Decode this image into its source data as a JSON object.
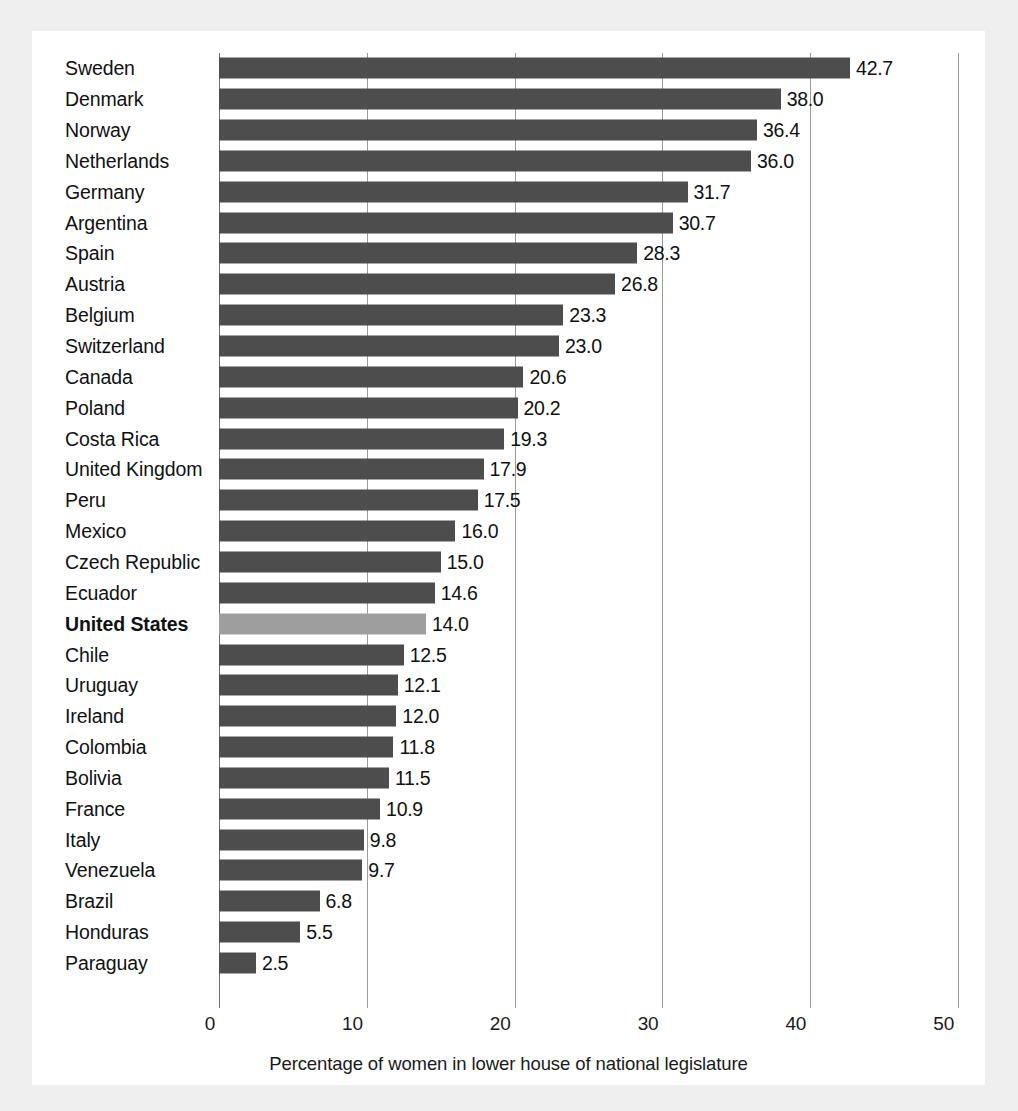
{
  "figure": {
    "panel_background": "#ffffff",
    "page_background": "#efefef",
    "bar_color": "#4d4d4d",
    "highlight_bar_color": "#9e9e9e",
    "gridline_color": "#9a9a9a"
  },
  "chart_data": {
    "type": "bar",
    "orientation": "horizontal",
    "title": "",
    "subtitle": "",
    "xlabel": "Percentage of women in lower house of national legislature",
    "ylabel": "",
    "xlim": [
      0,
      50
    ],
    "xticks": [
      "0",
      "10",
      "20",
      "30",
      "40",
      "50"
    ],
    "xtick_values": [
      0,
      10,
      20,
      30,
      40,
      50
    ],
    "grid": true,
    "grid_axis": "x",
    "legend": false,
    "legend_position": "none",
    "highlight_category": "United States",
    "value_label_format": "one-decimal",
    "categories": [
      "Sweden",
      "Denmark",
      "Norway",
      "Netherlands",
      "Germany",
      "Argentina",
      "Spain",
      "Austria",
      "Belgium",
      "Switzerland",
      "Canada",
      "Poland",
      "Costa Rica",
      "United Kingdom",
      "Peru",
      "Mexico",
      "Czech Republic",
      "Ecuador",
      "United States",
      "Chile",
      "Uruguay",
      "Ireland",
      "Colombia",
      "Bolivia",
      "France",
      "Italy",
      "Venezuela",
      "Brazil",
      "Honduras",
      "Paraguay"
    ],
    "values": [
      42.7,
      38.0,
      36.4,
      36.0,
      31.7,
      30.7,
      28.3,
      26.8,
      23.3,
      23.0,
      20.6,
      20.2,
      19.3,
      17.9,
      17.5,
      16.0,
      15.0,
      14.6,
      14.0,
      12.5,
      12.1,
      12.0,
      11.8,
      11.5,
      10.9,
      9.8,
      9.7,
      6.8,
      5.5,
      2.5
    ],
    "value_labels": [
      "42.7",
      "38.0",
      "36.4",
      "36.0",
      "31.7",
      "30.7",
      "28.3",
      "26.8",
      "23.3",
      "23.0",
      "20.6",
      "20.2",
      "19.3",
      "17.9",
      "17.5",
      "16.0",
      "15.0",
      "14.6",
      "14.0",
      "12.5",
      "12.1",
      "12.0",
      "11.8",
      "11.5",
      "10.9",
      "9.8",
      "9.7",
      "6.8",
      "5.5",
      "2.5"
    ]
  }
}
